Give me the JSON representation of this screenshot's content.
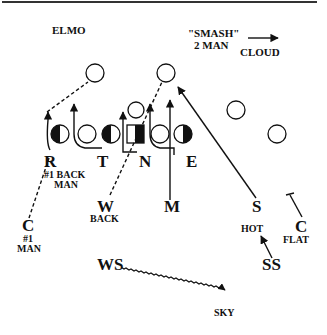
{
  "title": "ELMO",
  "call": {
    "line1": "\"SMASH\"",
    "line2": "2 MAN",
    "coverage": "CLOUD"
  },
  "offense": {
    "receivers": [
      "receiver-1",
      "receiver-2",
      "receiver-3",
      "receiver-4"
    ],
    "line": [
      "R",
      "T",
      "N",
      "E"
    ]
  },
  "defense": {
    "R": {
      "label": "R",
      "note1": "#1 BACK",
      "note2": "MAN"
    },
    "T": {
      "label": "T"
    },
    "N": {
      "label": "N"
    },
    "E": {
      "label": "E"
    },
    "W": {
      "label": "W",
      "note": "BACK"
    },
    "M": {
      "label": "M"
    },
    "S": {
      "label": "S"
    },
    "C_left": {
      "label": "C",
      "note1": "#1",
      "note2": "MAN"
    },
    "C_right": {
      "label": "C",
      "note": "FLAT"
    },
    "SS": {
      "label": "SS",
      "note": "HOT"
    },
    "WS": {
      "label": "WS",
      "note": "SKY"
    }
  },
  "colors": {
    "ink": "#111111",
    "background": "#ffffff"
  }
}
